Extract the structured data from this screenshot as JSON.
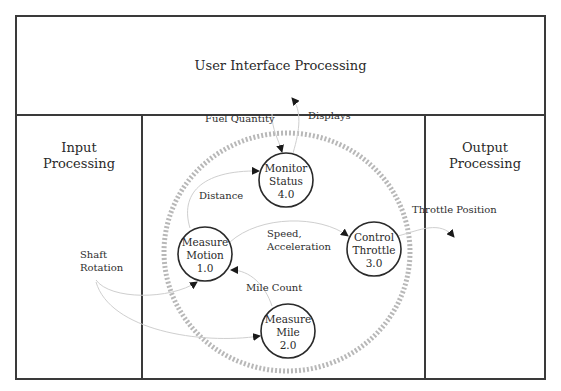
{
  "regions": {
    "user_interface": {
      "title": "User Interface Processing"
    },
    "input": {
      "title_line1": "Input",
      "title_line2": "Processing"
    },
    "output": {
      "title_line1": "Output",
      "title_line2": "Processing"
    }
  },
  "processes": [
    {
      "id": "1.0",
      "line1": "Measure",
      "line2": "Motion",
      "number": "1.0"
    },
    {
      "id": "2.0",
      "line1": "Measure",
      "line2": "Mile",
      "number": "2.0"
    },
    {
      "id": "3.0",
      "line1": "Control",
      "line2": "Throttle",
      "number": "3.0"
    },
    {
      "id": "4.0",
      "line1": "Monitor",
      "line2": "Status",
      "number": "4.0"
    }
  ],
  "flows": {
    "fuel_quantity": "Fuel Quantity",
    "displays": "Displays",
    "distance": "Distance",
    "speed_line1": "Speed,",
    "speed_line2": "Acceleration",
    "throttle_position": "Throttle Position",
    "shaft_line1": "Shaft",
    "shaft_line2": "Rotation",
    "mile_count": "Mile Count"
  },
  "colors": {
    "border": "#3a3a3a",
    "dashed_boundary": "#b8b8b8",
    "flow_line": "#cfcfcf",
    "arrowhead": "#1a1a1a"
  }
}
